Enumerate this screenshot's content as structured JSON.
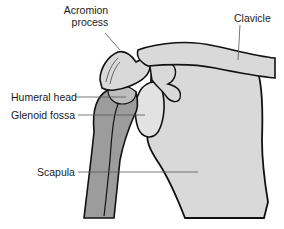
{
  "diagram": {
    "labels": {
      "acromion_line1": "Acromion",
      "acromion_line2": "process",
      "clavicle": "Clavicle",
      "humeral_head": "Humeral head",
      "glenoid_fossa": "Glenoid fossa",
      "scapula": "Scapula"
    },
    "colors": {
      "background": "#ffffff",
      "bone_light": "#d9d9d9",
      "bone_dark": "#9c9c9c",
      "outline": "#111111",
      "leader_line": "#555555",
      "text": "#1a1a1a"
    }
  }
}
